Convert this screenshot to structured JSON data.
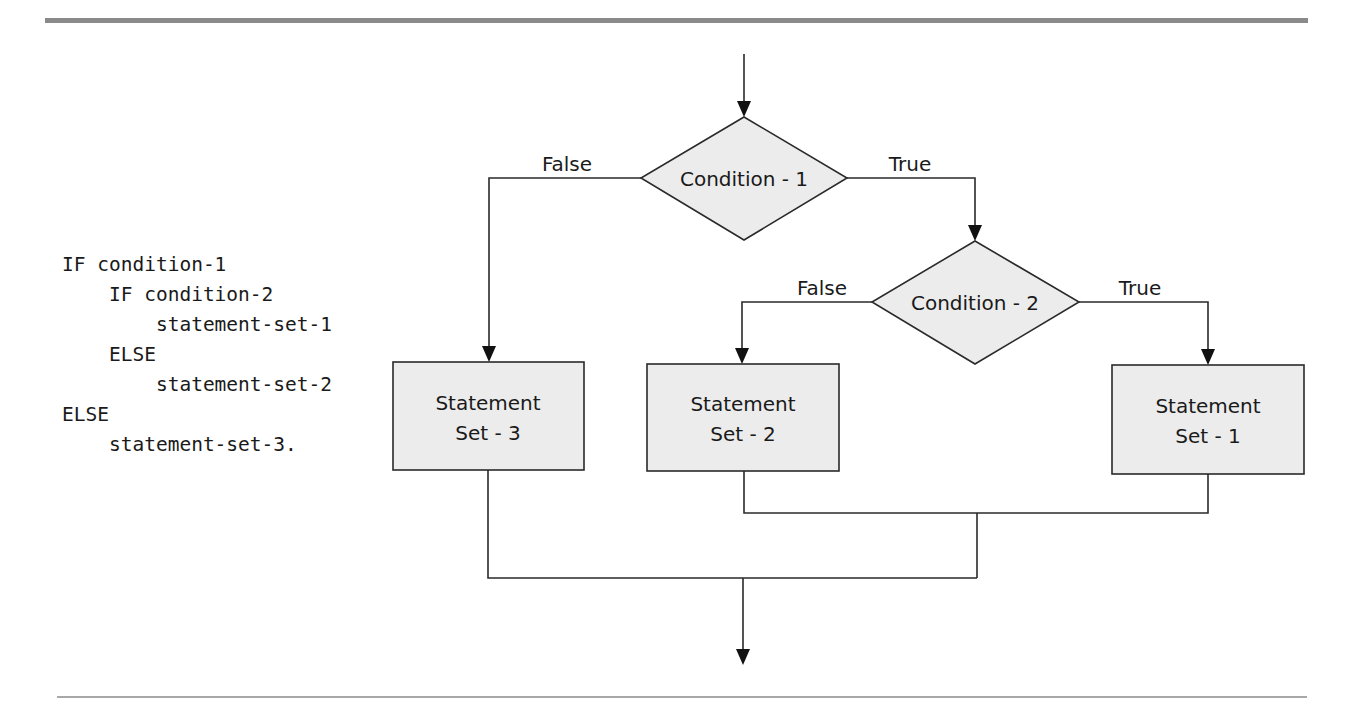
{
  "code": {
    "lines": [
      {
        "indent": 0,
        "text": "IF condition-1"
      },
      {
        "indent": 1,
        "text": "IF condition-2"
      },
      {
        "indent": 2,
        "text": "statement-set-1"
      },
      {
        "indent": 1,
        "text": "ELSE"
      },
      {
        "indent": 2,
        "text": "statement-set-2"
      },
      {
        "indent": 0,
        "text": "ELSE"
      },
      {
        "indent": 1,
        "text": "statement-set-3."
      }
    ],
    "rendered": [
      "IF condition-1",
      "    IF condition-2",
      "        statement-set-1",
      "    ELSE",
      "        statement-set-2",
      "ELSE",
      "    statement-set-3."
    ]
  },
  "flowchart": {
    "decisions": [
      {
        "id": "condition-1",
        "label": "Condition - 1"
      },
      {
        "id": "condition-2",
        "label": "Condition - 2"
      }
    ],
    "branches": {
      "c1_false": "False",
      "c1_true": "True",
      "c2_false": "False",
      "c2_true": "True"
    },
    "statements": [
      {
        "id": "statement-set-3",
        "line1": "Statement",
        "line2": "Set - 3"
      },
      {
        "id": "statement-set-2",
        "line1": "Statement",
        "line2": "Set - 2"
      },
      {
        "id": "statement-set-1",
        "line1": "Statement",
        "line2": "Set - 1"
      }
    ]
  },
  "colors": {
    "shape_fill": "#ececec",
    "stroke": "#2a2a2a",
    "top_rule": "#8a8a8a",
    "bottom_rule": "#a8a8a8"
  }
}
